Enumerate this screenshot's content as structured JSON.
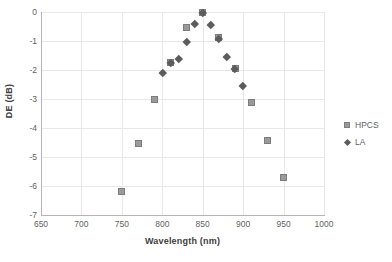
{
  "chart_data": {
    "type": "scatter",
    "title": "",
    "xlabel": "Wavelength (nm)",
    "ylabel": "DE (dB)",
    "xlim": [
      650,
      1000
    ],
    "ylim": [
      -7,
      0
    ],
    "xticks": [
      650,
      700,
      750,
      800,
      850,
      900,
      950,
      1000
    ],
    "yticks": [
      0,
      -1,
      -2,
      -3,
      -4,
      -5,
      -6,
      -7
    ],
    "xtick_labels": [
      "650",
      "700",
      "750",
      "800",
      "850",
      "900",
      "950",
      "1000"
    ],
    "ytick_labels": [
      "0",
      "-1",
      "-2",
      "-3",
      "-4",
      "-5",
      "-6",
      "-7"
    ],
    "grid": true,
    "legend_position": "right",
    "series": [
      {
        "name": "HPCS",
        "marker": "square",
        "color": "#9a9a9a",
        "x": [
          750,
          770,
          790,
          810,
          830,
          850,
          870,
          890,
          910,
          930,
          950
        ],
        "y": [
          -6.2,
          -4.55,
          -3.02,
          -1.75,
          -0.55,
          -0.03,
          -0.88,
          -1.95,
          -3.12,
          -4.42,
          -5.72
        ]
      },
      {
        "name": "LA",
        "marker": "diamond",
        "color": "#5c5c5c",
        "x": [
          800,
          810,
          820,
          830,
          840,
          850,
          860,
          870,
          880,
          890,
          900
        ],
        "y": [
          -2.1,
          -1.75,
          -1.62,
          -1.03,
          -0.42,
          -0.03,
          -0.45,
          -0.93,
          -1.53,
          -1.95,
          -2.55
        ]
      }
    ]
  },
  "legend": {
    "items": [
      {
        "label": "HPCS",
        "marker": "square"
      },
      {
        "label": "LA",
        "marker": "diamond"
      }
    ]
  }
}
